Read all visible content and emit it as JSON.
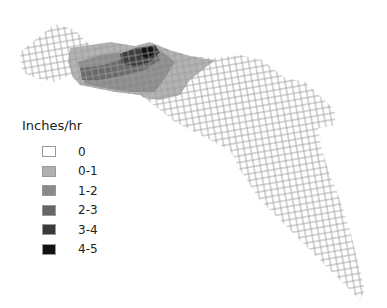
{
  "map": {
    "grid_cell_px": 6.5,
    "grid_line_color": "#9a9a9a",
    "outline_polygon": [
      [
        20,
        52
      ],
      [
        35,
        40
      ],
      [
        55,
        24
      ],
      [
        75,
        30
      ],
      [
        90,
        45
      ],
      [
        110,
        42
      ],
      [
        135,
        46
      ],
      [
        150,
        42
      ],
      [
        170,
        50
      ],
      [
        190,
        56
      ],
      [
        215,
        58
      ],
      [
        240,
        55
      ],
      [
        262,
        60
      ],
      [
        285,
        78
      ],
      [
        305,
        82
      ],
      [
        320,
        96
      ],
      [
        335,
        110
      ],
      [
        335,
        125
      ],
      [
        318,
        128
      ],
      [
        322,
        150
      ],
      [
        330,
        175
      ],
      [
        340,
        200
      ],
      [
        350,
        230
      ],
      [
        355,
        250
      ],
      [
        365,
        290
      ],
      [
        360,
        300
      ],
      [
        345,
        285
      ],
      [
        320,
        260
      ],
      [
        290,
        230
      ],
      [
        260,
        200
      ],
      [
        240,
        170
      ],
      [
        230,
        150
      ],
      [
        210,
        140
      ],
      [
        195,
        132
      ],
      [
        175,
        122
      ],
      [
        160,
        110
      ],
      [
        140,
        95
      ],
      [
        115,
        92
      ],
      [
        95,
        88
      ],
      [
        80,
        85
      ],
      [
        70,
        75
      ],
      [
        55,
        82
      ],
      [
        35,
        78
      ],
      [
        22,
        72
      ]
    ],
    "intensity_zones": [
      {
        "class": "0-1",
        "color": "#b3b3b3",
        "polygon": [
          [
            70,
            48
          ],
          [
            110,
            42
          ],
          [
            150,
            42
          ],
          [
            170,
            50
          ],
          [
            200,
            58
          ],
          [
            215,
            60
          ],
          [
            190,
            80
          ],
          [
            180,
            95
          ],
          [
            160,
            100
          ],
          [
            145,
            98
          ],
          [
            120,
            94
          ],
          [
            95,
            90
          ],
          [
            80,
            86
          ],
          [
            72,
            75
          ],
          [
            68,
            62
          ]
        ]
      },
      {
        "class": "1-2",
        "color": "#8c8c8c",
        "polygon": [
          [
            78,
            62
          ],
          [
            100,
            55
          ],
          [
            125,
            52
          ],
          [
            150,
            46
          ],
          [
            165,
            54
          ],
          [
            175,
            62
          ],
          [
            165,
            78
          ],
          [
            155,
            92
          ],
          [
            130,
            92
          ],
          [
            105,
            88
          ],
          [
            85,
            84
          ]
        ]
      },
      {
        "class": "2-3",
        "color": "#6a6a6a",
        "polygon": [
          [
            80,
            68
          ],
          [
            100,
            66
          ],
          [
            120,
            60
          ],
          [
            140,
            52
          ],
          [
            155,
            50
          ],
          [
            160,
            60
          ],
          [
            145,
            70
          ],
          [
            120,
            76
          ],
          [
            100,
            80
          ],
          [
            82,
            80
          ]
        ]
      },
      {
        "class": "3-4",
        "color": "#3d3d3d",
        "polygon": [
          [
            120,
            54
          ],
          [
            135,
            48
          ],
          [
            155,
            45
          ],
          [
            160,
            52
          ],
          [
            150,
            62
          ],
          [
            135,
            66
          ],
          [
            122,
            64
          ]
        ]
      },
      {
        "class": "4-5",
        "color": "#111111",
        "polygon": [
          [
            140,
            48
          ],
          [
            152,
            46
          ],
          [
            156,
            52
          ],
          [
            148,
            58
          ],
          [
            140,
            56
          ]
        ]
      }
    ]
  },
  "legend": {
    "title": "Inches/hr",
    "items": [
      {
        "label": "0",
        "color": "#ffffff"
      },
      {
        "label": "0-1",
        "color": "#b0b0b0"
      },
      {
        "label": "1-2",
        "color": "#8a8a8a"
      },
      {
        "label": "2-3",
        "color": "#666666"
      },
      {
        "label": "3-4",
        "color": "#3a3a3a"
      },
      {
        "label": "4-5",
        "color": "#111111"
      }
    ]
  }
}
